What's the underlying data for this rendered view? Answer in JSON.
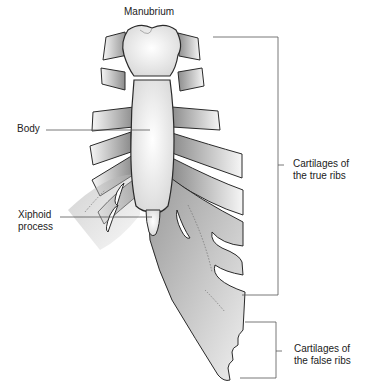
{
  "diagram": {
    "type": "anatomical-illustration",
    "labels": {
      "manubrium": "Manubrium",
      "body": "Body",
      "xiphoid_line1": "Xiphoid",
      "xiphoid_line2": "process",
      "true_ribs_line1": "Cartilages of",
      "true_ribs_line2": "the true ribs",
      "false_ribs_line1": "Cartilages of",
      "false_ribs_line2": "the false ribs"
    },
    "colors": {
      "outline": "#2a2a2a",
      "bone_fill": "#f2f2f2",
      "cartilage_dark": "#8a8a8a",
      "cartilage_light": "#f4f4f4",
      "leader_line": "#555555"
    }
  }
}
